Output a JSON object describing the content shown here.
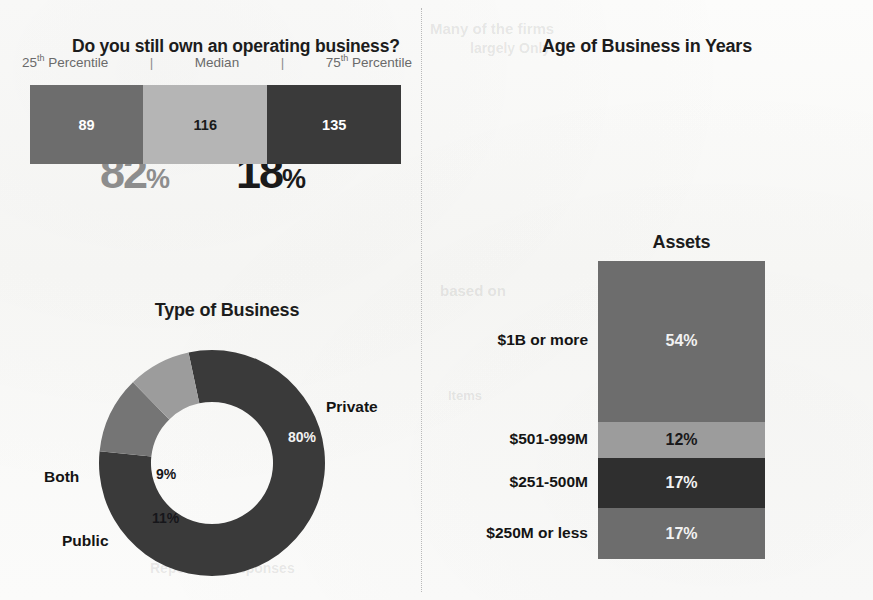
{
  "colors": {
    "page_background": "#fbfbfa",
    "ink": "#1c1c1c",
    "gray_light": "#b5b5b5",
    "gray_mid_light": "#9c9c9c",
    "gray_mid": "#6d6d6d",
    "gray_slice": "#757575",
    "gray_dark": "#3a3a3a",
    "yes_gray": "#8d8d8d",
    "no_black": "#1a1a1a"
  },
  "ownership": {
    "title": "Do you still own an operating business?",
    "yes": {
      "word": "YES",
      "value": "82",
      "symbol": "%",
      "icon": "thumbs-up-icon"
    },
    "no": {
      "word": "NO",
      "value": "18",
      "symbol": "%",
      "icon": "thumbs-down-icon"
    }
  },
  "type_of_business": {
    "title": "Type of Business",
    "chart_data": {
      "type": "pie",
      "title": "Type of Business",
      "categories": [
        "Private",
        "Public",
        "Both"
      ],
      "values": [
        80,
        11,
        9
      ],
      "value_labels": [
        "80%",
        "11%",
        "9%"
      ],
      "colors": [
        "#3a3a3a",
        "#757575",
        "#9c9c9c"
      ],
      "text_colors": [
        "#f2f2f2",
        "#16161a",
        "#16161a"
      ],
      "donut": true,
      "inner_radius_ratio": 0.54,
      "start_angle_deg": -12,
      "legend": "labels-outside",
      "xlabel": "",
      "ylabel": ""
    },
    "labels": {
      "private": "Private",
      "public": "Public",
      "both": "Both"
    }
  },
  "age_of_business": {
    "title": "Age of Business in Years",
    "legend": {
      "p25_prefix": "25",
      "p25_sup": "th",
      "p25_suffix": " Percentile",
      "separator": "|",
      "median": "Median",
      "p75_prefix": "75",
      "p75_sup": "th",
      "p75_suffix": " Percentile"
    },
    "chart_data": {
      "type": "bar",
      "title": "Age of Business in Years",
      "orientation": "horizontal-segments",
      "categories": [
        "25th Percentile",
        "Median",
        "75th Percentile"
      ],
      "values": [
        89,
        116,
        135
      ],
      "value_labels": [
        "89",
        "116",
        "135"
      ],
      "colors": [
        "#6d6d6d",
        "#b5b5b5",
        "#3a3a3a"
      ],
      "text_colors": [
        "#ffffff",
        "#1a1a1a",
        "#ffffff"
      ],
      "segment_width_pct": [
        30.5,
        33.5,
        36.0
      ],
      "xlabel": "",
      "ylabel": "Years"
    }
  },
  "assets": {
    "title": "Assets",
    "chart_data": {
      "type": "bar",
      "title": "Assets",
      "orientation": "stacked-vertical",
      "categories": [
        "$1B or more",
        "$501-999M",
        "$251-500M",
        "$250M or less"
      ],
      "values": [
        54,
        12,
        17,
        17
      ],
      "value_labels": [
        "54%",
        "12%",
        "17%",
        "17%"
      ],
      "colors": [
        "#6d6d6d",
        "#9c9c9c",
        "#2f2f2f",
        "#6d6d6d"
      ],
      "text_colors": [
        "#f2f2f2",
        "#18181a",
        "#f2f2f2",
        "#f2f2f2"
      ],
      "xlabel": "",
      "ylabel": "Share of respondents",
      "ylim": [
        0,
        100
      ]
    }
  },
  "ghost_text": {
    "g1": "Many of the firms",
    "g2": "largely Only",
    "g3": "based on",
    "g4": "Items",
    "g5": "Reporting Responses"
  }
}
